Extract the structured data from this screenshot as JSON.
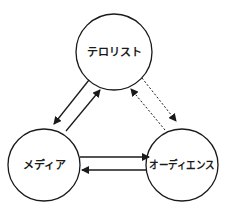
{
  "diagram": {
    "nodes": [
      {
        "id": "terrorist",
        "label": "テロリスト",
        "cx": 114,
        "cy": 52,
        "r": 38
      },
      {
        "id": "media",
        "label": "メディア",
        "cx": 44,
        "cy": 165,
        "r": 36
      },
      {
        "id": "audience",
        "label": "オーディエンス",
        "cx": 182,
        "cy": 165,
        "r": 36
      }
    ],
    "edges": [
      {
        "from": "terrorist",
        "to": "media",
        "style": "solid"
      },
      {
        "from": "media",
        "to": "terrorist",
        "style": "solid"
      },
      {
        "from": "terrorist",
        "to": "audience",
        "style": "dotted"
      },
      {
        "from": "audience",
        "to": "terrorist",
        "style": "dotted"
      },
      {
        "from": "media",
        "to": "audience",
        "style": "solid"
      },
      {
        "from": "audience",
        "to": "media",
        "style": "solid"
      }
    ],
    "colors": {
      "stroke": "#1a1a1a",
      "background": "#ffffff"
    }
  }
}
